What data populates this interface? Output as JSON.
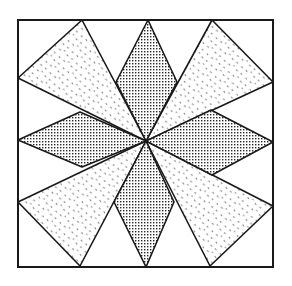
{
  "figure": {
    "colors": {
      "background": "#ffffff",
      "outline": "#1a1a1a",
      "hatch_dot": "#2a2a2a",
      "speckle": "#555555"
    },
    "border": {
      "x": 18,
      "y": 20,
      "width": 255,
      "height": 247
    },
    "center": [
      146,
      141
    ],
    "diamonds": [
      {
        "name": "top",
        "points": "148,20 177,82 146,141 116,82"
      },
      {
        "name": "bottom",
        "points": "146,141 174,202 146,267 114,202"
      },
      {
        "name": "left",
        "points": "18,140 80,112 146,141 82,167"
      },
      {
        "name": "right",
        "points": "146,141 211,110 273,142 212,175"
      }
    ],
    "speckled_triangles": [
      {
        "name": "top-left",
        "points": "82,20 18,78 146,141"
      },
      {
        "name": "top-right",
        "points": "212,20 273,82 146,141"
      },
      {
        "name": "bottom-left",
        "points": "18,202 80,266 146,141"
      },
      {
        "name": "bottom-right",
        "points": "273,206 210,266 146,141"
      }
    ]
  }
}
